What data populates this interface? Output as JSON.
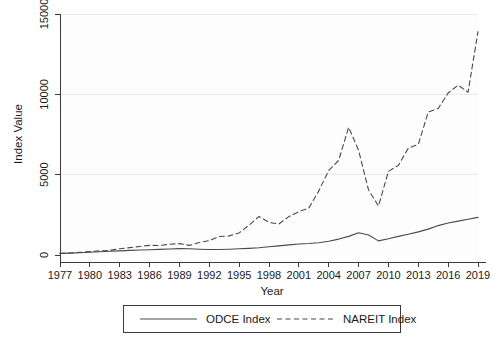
{
  "chart_data": {
    "type": "line",
    "title": "",
    "xlabel": "Year",
    "ylabel": "Index Value",
    "xlim": [
      1977,
      2019
    ],
    "ylim": [
      0,
      15000
    ],
    "grid": true,
    "legend_position": "below",
    "xticks": [
      1977,
      1980,
      1983,
      1986,
      1989,
      1992,
      1995,
      1998,
      2001,
      2004,
      2007,
      2010,
      2013,
      2016,
      2019
    ],
    "yticks": [
      0,
      5000,
      10000,
      15000
    ],
    "x": [
      1977,
      1978,
      1979,
      1980,
      1981,
      1982,
      1983,
      1984,
      1985,
      1986,
      1987,
      1988,
      1989,
      1990,
      1991,
      1992,
      1993,
      1994,
      1995,
      1996,
      1997,
      1998,
      1999,
      2000,
      2001,
      2002,
      2003,
      2004,
      2005,
      2006,
      2007,
      2008,
      2009,
      2010,
      2011,
      2012,
      2013,
      2014,
      2015,
      2016,
      2017,
      2018,
      2019
    ],
    "series": [
      {
        "name": "ODCE Index",
        "style": "solid",
        "color": "#4a4a4a",
        "values": [
          100,
          115,
          140,
          170,
          205,
          230,
          255,
          285,
          310,
          330,
          350,
          375,
          395,
          390,
          360,
          340,
          345,
          360,
          385,
          415,
          455,
          510,
          570,
          630,
          680,
          715,
          765,
          855,
          990,
          1160,
          1380,
          1240,
          880,
          1010,
          1160,
          1290,
          1440,
          1610,
          1830,
          1990,
          2110,
          2230,
          2340
        ]
      },
      {
        "name": "NAREIT Index",
        "style": "dashed",
        "color": "#4a4a4a",
        "values": [
          100,
          125,
          165,
          215,
          260,
          290,
          390,
          460,
          530,
          600,
          590,
          670,
          710,
          600,
          775,
          895,
          1150,
          1190,
          1375,
          1860,
          2400,
          2030,
          1930,
          2390,
          2700,
          2920,
          3990,
          5260,
          5890,
          7950,
          6520,
          4050,
          3050,
          5200,
          5580,
          6650,
          6880,
          8900,
          9120,
          10080,
          10570,
          10130,
          13900
        ]
      }
    ]
  },
  "legend": {
    "items": [
      {
        "label": "ODCE Index",
        "style": "solid"
      },
      {
        "label": "NAREIT Index",
        "style": "dashed"
      }
    ]
  }
}
